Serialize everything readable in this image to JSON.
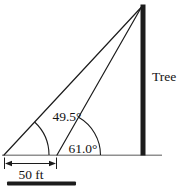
{
  "figure": {
    "labels": {
      "tree": "Tree",
      "angle_far": "49.5°",
      "angle_near": "61.0°",
      "baseline_distance": "50 ft"
    },
    "values": {
      "angle_far_deg": 49.5,
      "angle_near_deg": 61.0,
      "baseline_ft": 50
    },
    "colors": {
      "line": "#1c1c1c",
      "ground": "#8f8f8f",
      "text": "#141414",
      "background": "#ffffff"
    }
  }
}
